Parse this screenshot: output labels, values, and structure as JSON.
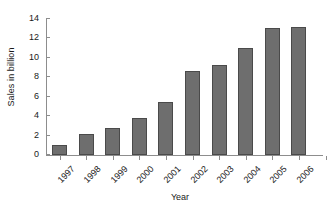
{
  "chart_data": {
    "type": "bar",
    "title": "",
    "xlabel": "Year",
    "ylabel": "Sales in billion",
    "categories": [
      "1997",
      "1998",
      "1999",
      "2000",
      "2001",
      "2002",
      "2003",
      "2004",
      "2005",
      "2006"
    ],
    "values": [
      1.0,
      2.2,
      2.8,
      3.8,
      5.5,
      8.7,
      9.3,
      11.0,
      13.1,
      13.2
    ],
    "ylim": [
      0,
      14
    ],
    "yticks": [
      0,
      2,
      4,
      6,
      8,
      10,
      12,
      14
    ],
    "ytick_labels": [
      "0",
      "2",
      "4",
      "6",
      "8",
      "10",
      "12",
      "14"
    ],
    "grid": false,
    "legend": false,
    "bar_color": "#6e6e6e",
    "bar_edge_color": "#4a4a4a",
    "axis_color": "#8d8d8d",
    "background": "#ffffff"
  }
}
